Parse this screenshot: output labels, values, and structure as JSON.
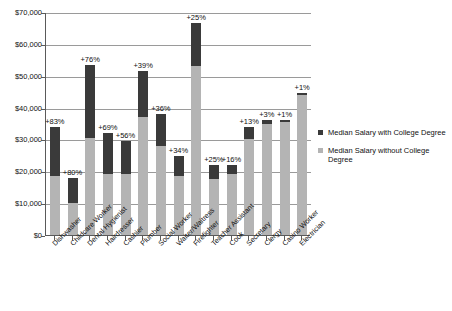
{
  "chart_data": {
    "type": "bar",
    "title": "",
    "subtitle": "",
    "xlabel": "",
    "ylabel": "",
    "ylim": [
      0,
      70000
    ],
    "ytick_step": 10000,
    "grid": true,
    "stacked": true,
    "legend_position": "right",
    "colors": {
      "with_degree": "#3a3a3a",
      "without_degree": "#b4b4b4",
      "gridline": "#9a9a9a",
      "axis": "#5a5a5a",
      "background": "#ffffff"
    },
    "ytick_labels": [
      "$70,000",
      "$60,000",
      "$50,000",
      "$40,000",
      "$30,000",
      "$20,000",
      "$10,000",
      "$0"
    ],
    "ytick_values": [
      70000,
      60000,
      50000,
      40000,
      30000,
      20000,
      10000,
      0
    ],
    "categories": [
      "Dishwasher",
      "Childcare Worker",
      "Dental Hygienist",
      "Hairdresser",
      "Cashier",
      "Plumber",
      "Social Worker",
      "Waiter/Waitress",
      "Firefighter",
      "Teacher Assistant",
      "Cook",
      "Secretary",
      "Clergy",
      "Casino Worker",
      "Electrician"
    ],
    "series": [
      {
        "name": "Median Salary without College Degree",
        "key": "without_degree",
        "values": [
          18500,
          10000,
          30500,
          19000,
          19000,
          37000,
          28000,
          18500,
          53000,
          17500,
          19000,
          30000,
          35000,
          35500,
          44000
        ]
      },
      {
        "name": "Median Salary with College Degree",
        "key": "with_degree",
        "values": [
          34000,
          18000,
          53500,
          32000,
          29500,
          51500,
          38000,
          24800,
          66500,
          22000,
          22000,
          34000,
          36000,
          36000,
          44500
        ]
      }
    ],
    "annotations": [
      {
        "category": "Dishwasher",
        "label": "+83%",
        "value": 83
      },
      {
        "category": "Childcare Worker",
        "label": "+80%",
        "value": 80
      },
      {
        "category": "Dental Hygienist",
        "label": "+76%",
        "value": 76
      },
      {
        "category": "Hairdresser",
        "label": "+69%",
        "value": 69
      },
      {
        "category": "Cashier",
        "label": "+56%",
        "value": 56
      },
      {
        "category": "Plumber",
        "label": "+39%",
        "value": 39
      },
      {
        "category": "Social Worker",
        "label": "+36%",
        "value": 36
      },
      {
        "category": "Waiter/Waitress",
        "label": "+34%",
        "value": 34
      },
      {
        "category": "Firefighter",
        "label": "+25%",
        "value": 25
      },
      {
        "category": "Teacher Assistant",
        "label": "+25%",
        "value": 25
      },
      {
        "category": "Cook",
        "label": "+16%",
        "value": 16
      },
      {
        "category": "Secretary",
        "label": "+13%",
        "value": 13
      },
      {
        "category": "Clergy",
        "label": "+3%",
        "value": 3
      },
      {
        "category": "Casino Worker",
        "label": "+1%",
        "value": 1
      },
      {
        "category": "Electrician",
        "label": "+1%",
        "value": 1
      }
    ],
    "legend": [
      {
        "label": "Median Salary with College Degree",
        "color": "#3a3a3a"
      },
      {
        "label": "Median Salary without College Degree",
        "color": "#b4b4b4"
      }
    ]
  }
}
